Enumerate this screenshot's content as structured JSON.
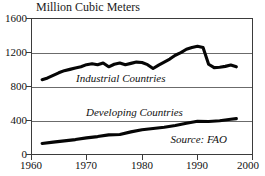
{
  "chart_data": {
    "type": "line",
    "title": "Million Cubic Meters",
    "xlabel": "",
    "ylabel": "Million Cubic Meters",
    "xlim": [
      1960,
      2000
    ],
    "ylim": [
      0,
      1600
    ],
    "grid": true,
    "legend_position": "inline-annotation",
    "yticks": [
      0,
      400,
      800,
      1200,
      1600
    ],
    "xticks": [
      1960,
      1970,
      1980,
      1990,
      2000
    ],
    "annotations": [
      {
        "text": "Industrial Countries",
        "series": "Industrial Countries"
      },
      {
        "text": "Developing Countries",
        "series": "Developing Countries"
      },
      {
        "text": "Source: FAO",
        "role": "source-note"
      }
    ],
    "series": [
      {
        "name": "Industrial Countries",
        "x": [
          1962,
          1963,
          1964,
          1965,
          1966,
          1967,
          1968,
          1969,
          1970,
          1971,
          1972,
          1973,
          1974,
          1975,
          1976,
          1977,
          1978,
          1979,
          1980,
          1981,
          1982,
          1983,
          1984,
          1985,
          1986,
          1987,
          1988,
          1989,
          1990,
          1991,
          1992,
          1993,
          1994,
          1995,
          1996,
          1997
        ],
        "values": [
          880,
          900,
          930,
          960,
          985,
          1000,
          1015,
          1030,
          1055,
          1065,
          1055,
          1075,
          1030,
          1060,
          1075,
          1055,
          1070,
          1085,
          1080,
          1055,
          1010,
          1050,
          1085,
          1120,
          1165,
          1195,
          1235,
          1255,
          1270,
          1255,
          1060,
          1020,
          1025,
          1035,
          1050,
          1030
        ]
      },
      {
        "name": "Developing Countries",
        "x": [
          1962,
          1964,
          1966,
          1968,
          1970,
          1972,
          1974,
          1976,
          1978,
          1980,
          1982,
          1984,
          1986,
          1988,
          1990,
          1992,
          1994,
          1996,
          1997
        ],
        "values": [
          135,
          150,
          165,
          180,
          200,
          215,
          235,
          240,
          270,
          295,
          310,
          325,
          345,
          370,
          395,
          392,
          400,
          418,
          425
        ]
      }
    ]
  },
  "axes": {
    "y_tick_labels": [
      "1600",
      "1200",
      "800",
      "400",
      "0"
    ],
    "x_tick_labels": [
      "1960",
      "1970",
      "1980",
      "1990",
      "2000"
    ]
  },
  "labels": {
    "title": "Million Cubic Meters",
    "industrial": "Industrial Countries",
    "developing": "Developing Countries",
    "source": "Source: FAO"
  },
  "colors": {
    "series_line": "#050505",
    "gridline": "#6b6b6b",
    "frame": "#3b3b3b",
    "background": "#ffffff",
    "text": "#111111"
  }
}
